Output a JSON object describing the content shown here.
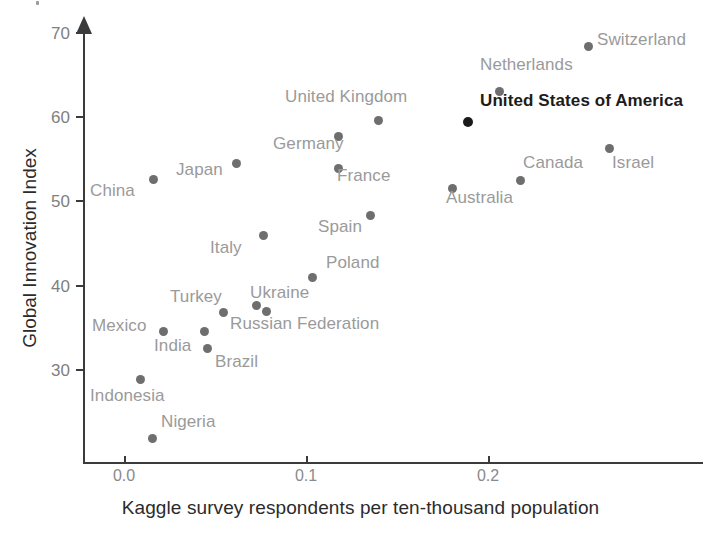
{
  "chart_data": {
    "type": "scatter",
    "title": "",
    "xlabel": "Kaggle survey respondents per ten-thousand population",
    "ylabel": "Global Innovation Index",
    "xlim": [
      -0.023,
      0.245
    ],
    "ylim": [
      21.0,
      71.5
    ],
    "xticks": [
      0.0,
      0.1,
      0.2
    ],
    "xtick_labels": [
      "0.0",
      "0.1",
      "0.2"
    ],
    "yticks": [
      30,
      40,
      50,
      60,
      70
    ],
    "ytick_labels": [
      "30",
      "40",
      "50",
      "60",
      "70"
    ],
    "grid": false,
    "legend": null,
    "highlight_color": "#1a1a1a",
    "point_color": "#6e6e6e",
    "label_color": "#9a9a9a",
    "axis_color": "#3b3b3b",
    "points": [
      {
        "name": "Switzerland",
        "x": 0.2,
        "y": 68.8,
        "px": 588,
        "py": 46,
        "label_dx": 9,
        "label_dy": -7,
        "highlight": false
      },
      {
        "name": "Netherlands",
        "x": 0.159,
        "y": 63.1,
        "px": 499,
        "py": 91,
        "label_dx": -19,
        "label_dy": -27,
        "highlight": false
      },
      {
        "name": "United States of America",
        "x": 0.142,
        "y": 59.4,
        "px": 468,
        "py": 122,
        "label_dx": 12,
        "label_dy": -22,
        "highlight": true
      },
      {
        "name": "United Kingdom",
        "x": 0.106,
        "y": 59.7,
        "px": 378,
        "py": 120,
        "label_dx": -93,
        "label_dy": -24,
        "highlight": false
      },
      {
        "name": "Germany",
        "x": 0.0885,
        "y": 57.8,
        "px": 338,
        "py": 136,
        "label_dx": -65,
        "label_dy": 7,
        "highlight": false
      },
      {
        "name": "France",
        "x": 0.0885,
        "y": 53.9,
        "px": 338,
        "py": 168,
        "label_dx": -1,
        "label_dy": 7,
        "highlight": false
      },
      {
        "name": "Israel",
        "x": 0.207,
        "y": 56.4,
        "px": 609,
        "py": 148,
        "label_dx": 3,
        "label_dy": 14,
        "highlight": false
      },
      {
        "name": "Canada",
        "x": 0.166,
        "y": 52.6,
        "px": 520,
        "py": 180,
        "label_dx": 3,
        "label_dy": -18,
        "highlight": false
      },
      {
        "name": "Australia",
        "x": 0.14,
        "y": 51.6,
        "px": 452,
        "py": 188,
        "label_dx": -6,
        "label_dy": 9,
        "highlight": false
      },
      {
        "name": "Japan",
        "x": 0.045,
        "y": 54.5,
        "px": 236,
        "py": 163,
        "label_dx": -60,
        "label_dy": 6,
        "highlight": false
      },
      {
        "name": "China",
        "x": 0.012,
        "y": 52.8,
        "px": 153,
        "py": 179,
        "label_dx": -63,
        "label_dy": 11,
        "highlight": false
      },
      {
        "name": "Spain",
        "x": 0.1025,
        "y": 48.6,
        "px": 370,
        "py": 215,
        "label_dx": -52,
        "label_dy": 11,
        "highlight": false
      },
      {
        "name": "Italy",
        "x": 0.0575,
        "y": 46.0,
        "px": 263,
        "py": 235,
        "label_dx": -53,
        "label_dy": 12,
        "highlight": false
      },
      {
        "name": "Poland",
        "x": 0.077,
        "y": 41.6,
        "px": 312,
        "py": 277,
        "label_dx": 14,
        "label_dy": -15,
        "highlight": false
      },
      {
        "name": "Ukraine",
        "x": 0.056,
        "y": 38.9,
        "px": 256,
        "py": 305,
        "label_dx": -6,
        "label_dy": -13,
        "highlight": false
      },
      {
        "name": "Russian Federation",
        "x": 0.0615,
        "y": 38.2,
        "px": 266,
        "py": 311,
        "label_dx": -36,
        "label_dy": 12,
        "highlight": false
      },
      {
        "name": "Turkey",
        "x": 0.054,
        "y": 37.0,
        "px": 223,
        "py": 312,
        "label_dx": -53,
        "label_dy": -16,
        "highlight": false
      },
      {
        "name": "Mexico",
        "x": 0.0215,
        "y": 35.3,
        "px": 163,
        "py": 331,
        "label_dx": -71,
        "label_dy": -6,
        "highlight": false
      },
      {
        "name": "India",
        "x": 0.044,
        "y": 35.3,
        "px": 204,
        "py": 331,
        "label_dx": -50,
        "label_dy": 14,
        "highlight": false
      },
      {
        "name": "Brazil",
        "x": 0.0455,
        "y": 33.3,
        "px": 207,
        "py": 348,
        "label_dx": 8,
        "label_dy": 13,
        "highlight": false
      },
      {
        "name": "Indonesia",
        "x": 0.009,
        "y": 29.9,
        "px": 140,
        "py": 379,
        "label_dx": -50,
        "label_dy": 16,
        "highlight": false
      },
      {
        "name": "Nigeria",
        "x": 0.0155,
        "y": 22.9,
        "px": 152,
        "py": 438,
        "label_dx": 9,
        "label_dy": -17,
        "highlight": false
      }
    ]
  },
  "axes": {
    "x_title": "Kaggle survey respondents per ten-thousand population",
    "y_title": "Global Innovation Index",
    "x_tick_positions_px": [
      124,
      306,
      488
    ],
    "y_tick_positions_px": [
      370,
      286,
      201,
      117,
      33
    ]
  }
}
